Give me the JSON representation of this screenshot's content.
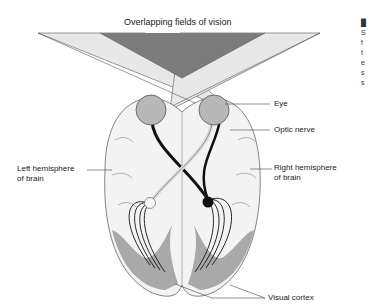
{
  "title": "Overlapping fields of vision",
  "labels": {
    "eye": "Eye",
    "optic_nerve": "Optic nerve",
    "left_hemisphere_1": "Left hemisphere",
    "left_hemisphere_2": "of brain",
    "right_hemisphere_1": "Right hemisphere",
    "right_hemisphere_2": "of brain",
    "visual_cortex": "Visual cortex"
  },
  "side_caption_fragment": [
    "S",
    "f",
    "t",
    "e",
    "s",
    "s"
  ],
  "colors": {
    "field_light": "#e6e6e6",
    "field_overlap": "#7a7a7a",
    "eye": "#b5b5b5",
    "brain": "#f2f2f2",
    "cortex": "#a8a8a8",
    "nerve": "#111111"
  }
}
